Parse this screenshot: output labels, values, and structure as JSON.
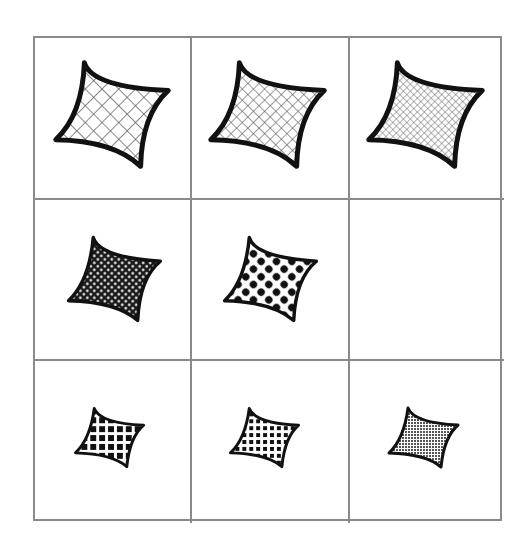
{
  "figure": {
    "type": "3x3 pattern matrix puzzle",
    "grid": {
      "rows": 3,
      "cols": 3,
      "line_color": "#8a8a8a"
    },
    "cells": [
      {
        "row": 1,
        "col": 1,
        "shape": "four-point-concave-star",
        "size": "large",
        "fill": "diagonal-crosshatch-coarse",
        "stroke": "thick"
      },
      {
        "row": 1,
        "col": 2,
        "shape": "four-point-concave-star",
        "size": "large",
        "fill": "diagonal-crosshatch-medium",
        "stroke": "thick"
      },
      {
        "row": 1,
        "col": 3,
        "shape": "four-point-concave-star",
        "size": "large",
        "fill": "diagonal-crosshatch-fine",
        "stroke": "thick"
      },
      {
        "row": 2,
        "col": 1,
        "shape": "four-point-concave-star",
        "size": "medium",
        "fill": "dots-small-dense",
        "stroke": "medium"
      },
      {
        "row": 2,
        "col": 2,
        "shape": "four-point-concave-star",
        "size": "medium",
        "fill": "dots-large",
        "stroke": "medium"
      },
      {
        "row": 2,
        "col": 3,
        "shape": "empty",
        "size": "",
        "fill": "",
        "stroke": ""
      },
      {
        "row": 3,
        "col": 1,
        "shape": "four-point-concave-star",
        "size": "small",
        "fill": "square-grid-coarse",
        "stroke": "thin"
      },
      {
        "row": 3,
        "col": 2,
        "shape": "four-point-concave-star",
        "size": "small",
        "fill": "square-grid-medium",
        "stroke": "thin"
      },
      {
        "row": 3,
        "col": 3,
        "shape": "four-point-concave-star",
        "size": "small",
        "fill": "square-grid-fine",
        "stroke": "thin"
      }
    ],
    "colors": {
      "stroke": "#111111",
      "hatch": "#555555",
      "background": "#ffffff"
    }
  }
}
